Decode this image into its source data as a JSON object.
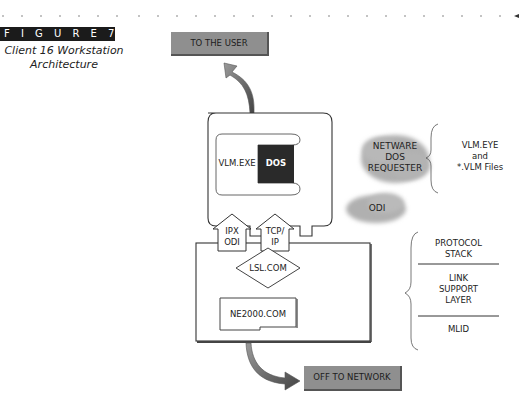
{
  "figure": {
    "label": "F I G U R E   7.25",
    "caption_line1": "Client 16 Workstation",
    "caption_line2": "Architecture"
  },
  "diagram": {
    "top_box": "TO THE USER",
    "bottom_box": "OFF TO NETWORK",
    "vlm_exe": "VLM.EXE",
    "dos": "DOS",
    "ipx_odi_line1": "IPX",
    "ipx_odi_line2": "ODI",
    "tcpip_line1": "TCP/",
    "tcpip_line2": "IP",
    "lsl": "LSL.COM",
    "ne2000": "NE2000.COM"
  },
  "clouds": {
    "requester_line1": "NETWARE",
    "requester_line2": "DOS",
    "requester_line3": "REQUESTER",
    "odi": "ODI"
  },
  "right_labels": {
    "vlm_line1": "VLM.EYE",
    "vlm_line2": "and",
    "vlm_line3": "*.VLM Files",
    "protocol_line1": "PROTOCOL",
    "protocol_line2": "STACK",
    "link_line1": "LINK",
    "link_line2": "SUPPORT",
    "link_line3": "LAYER",
    "mlid": "MLID"
  },
  "colors": {
    "gray_box": "#8f8f8f",
    "dark_bar": "#1b1b1b",
    "cloud": "#b5b5b5",
    "dos_box": "#2a2a2a"
  }
}
